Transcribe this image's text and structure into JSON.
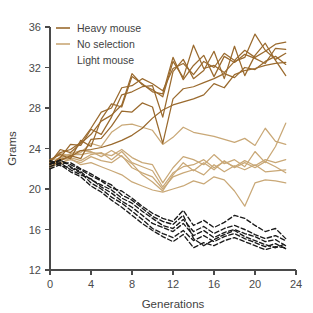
{
  "chart_data": {
    "type": "line",
    "title": "",
    "xlabel": "Generations",
    "ylabel": "Grams",
    "xlim": [
      0,
      24
    ],
    "ylim": [
      12,
      36
    ],
    "xticks": [
      0,
      4,
      8,
      12,
      16,
      20,
      24
    ],
    "yticks": [
      12,
      16,
      20,
      24,
      28,
      32,
      36
    ],
    "grid": false,
    "legend_position": "top-left",
    "legend": [
      {
        "label": "Heavy mouse",
        "color": "#9a6a2e",
        "dash": "solid",
        "swatch": true
      },
      {
        "label": "No selection",
        "color": "#c9a877",
        "dash": "solid",
        "swatch": true
      },
      {
        "label": "Light mouse",
        "color": "#1a1a1a",
        "dash": "dashed",
        "swatch": false
      }
    ],
    "x": [
      0,
      1,
      2,
      3,
      4,
      5,
      6,
      7,
      8,
      9,
      10,
      11,
      12,
      13,
      14,
      15,
      16,
      17,
      18,
      19,
      20,
      21,
      22,
      23
    ],
    "groups": [
      {
        "name": "Heavy mouse",
        "color": "#9a6a2e",
        "dash": "solid",
        "series": [
          {
            "name": "heavy-1",
            "values": [
              22.6,
              23.9,
              23.6,
              24.5,
              25.4,
              26.7,
              27.3,
              28.3,
              31.4,
              30.3,
              29.8,
              29.1,
              32.6,
              31.0,
              34.2,
              31.9,
              32.2,
              31.5,
              32.6,
              33.0,
              35.3,
              33.7,
              32.8,
              33.4
            ]
          },
          {
            "name": "heavy-2",
            "values": [
              22.4,
              23.1,
              24.4,
              24.3,
              25.9,
              25.4,
              27.1,
              29.3,
              29.6,
              30.1,
              30.2,
              27.1,
              31.6,
              32.8,
              30.9,
              31.7,
              33.6,
              30.9,
              34.1,
              31.2,
              33.2,
              34.4,
              32.7,
              31.2
            ]
          },
          {
            "name": "heavy-3",
            "values": [
              22.9,
              23.4,
              23.0,
              24.8,
              24.2,
              26.9,
              28.4,
              28.1,
              31.1,
              30.4,
              29.6,
              29.4,
              33.0,
              30.8,
              32.2,
              33.2,
              31.1,
              33.1,
              32.5,
              33.3,
              32.9,
              32.4,
              33.9,
              33.8
            ]
          },
          {
            "name": "heavy-4",
            "values": [
              22.2,
              22.8,
              23.3,
              23.0,
              24.9,
              25.0,
              26.2,
              27.7,
              27.6,
              28.5,
              28.1,
              24.5,
              28.9,
              29.9,
              30.1,
              30.5,
              30.9,
              31.4,
              31.0,
              32.0,
              31.8,
              32.6,
              33.1,
              32.3
            ]
          },
          {
            "name": "heavy-5",
            "values": [
              22.7,
              23.6,
              23.9,
              24.6,
              26.0,
              27.6,
              28.0,
              30.0,
              30.2,
              30.9,
              30.4,
              29.7,
              31.9,
              32.4,
              31.3,
              32.6,
              32.0,
              33.4,
              32.7,
              33.7,
              33.0,
              33.6,
              34.3,
              34.5
            ]
          },
          {
            "name": "heavy-6",
            "values": [
              22.5,
              22.9,
              23.2,
              23.8,
              23.9,
              24.1,
              24.4,
              24.8,
              25.3,
              26.0,
              27.0,
              27.8,
              28.3,
              28.6,
              28.9,
              29.3,
              30.4,
              30.0,
              31.3,
              31.7,
              31.9,
              32.2,
              32.4,
              32.5
            ]
          }
        ]
      },
      {
        "name": "No selection",
        "color": "#c9a877",
        "dash": "solid",
        "series": [
          {
            "name": "nosel-1",
            "values": [
              22.8,
              23.5,
              23.3,
              23.6,
              24.5,
              24.2,
              25.6,
              26.3,
              26.4,
              26.1,
              25.8,
              24.4,
              25.1,
              26.1,
              25.6,
              25.4,
              25.2,
              24.9,
              24.6,
              25.0,
              24.3,
              26.0,
              24.7,
              24.4
            ]
          },
          {
            "name": "nosel-2",
            "values": [
              22.3,
              23.2,
              23.4,
              23.4,
              23.6,
              23.5,
              23.3,
              23.9,
              23.1,
              22.6,
              22.4,
              20.6,
              22.1,
              23.2,
              22.9,
              22.4,
              23.4,
              22.5,
              22.9,
              22.2,
              23.7,
              22.6,
              24.2,
              26.5
            ]
          },
          {
            "name": "nosel-3",
            "values": [
              22.6,
              22.4,
              23.1,
              22.8,
              23.4,
              23.6,
              22.9,
              23.7,
              22.6,
              22.2,
              21.8,
              20.2,
              21.6,
              22.2,
              22.4,
              22.9,
              22.1,
              22.7,
              22.2,
              22.8,
              22.3,
              22.9,
              22.6,
              22.9
            ]
          },
          {
            "name": "nosel-4",
            "values": [
              22.1,
              22.6,
              22.9,
              22.6,
              23.2,
              22.8,
              22.6,
              23.3,
              22.1,
              21.6,
              21.2,
              20.0,
              21.2,
              21.6,
              21.9,
              21.4,
              22.4,
              21.7,
              22.3,
              21.9,
              22.4,
              21.7,
              21.8,
              21.9
            ]
          },
          {
            "name": "nosel-5",
            "values": [
              22.9,
              23.0,
              23.5,
              23.8,
              23.7,
              23.2,
              23.8,
              23.2,
              22.5,
              21.4,
              20.7,
              19.8,
              21.4,
              22.6,
              21.8,
              22.6,
              21.9,
              22.8,
              22.1,
              22.6,
              22.1,
              22.7,
              22.2,
              21.6
            ]
          },
          {
            "name": "nosel-6",
            "values": [
              22.4,
              22.9,
              23.0,
              22.4,
              22.6,
              22.2,
              21.8,
              21.4,
              20.7,
              20.3,
              19.9,
              19.7,
              20.0,
              20.3,
              20.8,
              20.5,
              21.2,
              20.9,
              19.8,
              18.3,
              20.6,
              20.9,
              20.8,
              20.6
            ]
          }
        ]
      },
      {
        "name": "Light mouse",
        "color": "#1a1a1a",
        "dash": "dashed",
        "series": [
          {
            "name": "light-1",
            "values": [
              22.5,
              22.8,
              22.4,
              21.9,
              21.3,
              20.8,
              20.1,
              19.8,
              19.1,
              18.3,
              17.6,
              17.1,
              16.8,
              17.9,
              16.4,
              16.9,
              16.2,
              16.7,
              17.4,
              17.1,
              16.4,
              15.8,
              16.1,
              15.1
            ]
          },
          {
            "name": "light-2",
            "values": [
              22.2,
              22.6,
              21.9,
              21.4,
              21.0,
              20.2,
              19.6,
              18.8,
              18.2,
              17.4,
              16.6,
              16.2,
              15.8,
              16.6,
              15.4,
              15.9,
              15.2,
              15.7,
              16.0,
              15.6,
              15.3,
              14.8,
              15.0,
              14.4
            ]
          },
          {
            "name": "light-3",
            "values": [
              22.7,
              22.3,
              22.1,
              21.6,
              20.6,
              20.0,
              19.2,
              18.6,
              17.8,
              17.0,
              16.1,
              15.6,
              15.2,
              15.9,
              14.9,
              15.4,
              14.8,
              15.3,
              15.6,
              15.1,
              14.7,
              14.3,
              14.6,
              14.1
            ]
          },
          {
            "name": "light-4",
            "values": [
              22.4,
              22.9,
              22.2,
              21.7,
              20.9,
              20.4,
              19.9,
              19.1,
              18.6,
              17.8,
              17.1,
              16.4,
              16.1,
              17.0,
              15.8,
              16.3,
              15.6,
              16.1,
              16.4,
              16.0,
              15.5,
              15.1,
              15.4,
              14.9
            ]
          },
          {
            "name": "light-5",
            "values": [
              22.0,
              22.4,
              21.7,
              21.2,
              20.3,
              19.7,
              18.9,
              18.2,
              17.4,
              16.6,
              15.9,
              15.3,
              14.8,
              15.5,
              14.2,
              14.7,
              14.4,
              14.9,
              15.2,
              14.8,
              14.4,
              14.0,
              14.3,
              14.2
            ]
          },
          {
            "name": "light-6",
            "values": [
              22.8,
              22.5,
              22.6,
              22.0,
              21.5,
              20.9,
              20.4,
              19.4,
              18.9,
              18.1,
              17.3,
              16.8,
              16.5,
              17.4,
              15.1,
              14.4,
              15.0,
              15.5,
              15.9,
              15.3,
              14.9,
              14.5,
              14.2,
              14.6
            ]
          }
        ]
      }
    ]
  },
  "axes": {
    "ylabel": "Grams",
    "xlabel": "Generations"
  }
}
